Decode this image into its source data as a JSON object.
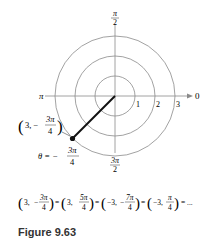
{
  "figure": {
    "caption": "Figure 9.63",
    "axis_labels": {
      "top_num": "π",
      "top_den": "2",
      "bottom_num": "3π",
      "bottom_den": "2",
      "left": "π",
      "right": "0"
    },
    "ring_labels": [
      "1",
      "2",
      "3"
    ],
    "point": {
      "r": "3",
      "theta_num": "3π",
      "theta_den": "4",
      "theta_sign": "−",
      "label_prefix": "3, −"
    },
    "theta_label": {
      "lhs": "θ = −",
      "num": "3π",
      "den": "4"
    },
    "equivalence": {
      "terms": [
        {
          "r": "3,",
          "sign": "−",
          "num": "3π",
          "den": "4"
        },
        {
          "r": "3,",
          "sign": "",
          "num": "5π",
          "den": "4"
        },
        {
          "r": "−3,",
          "sign": "−",
          "num": "7π",
          "den": "4"
        },
        {
          "r": "−3,",
          "sign": "",
          "num": "π",
          "den": "4"
        }
      ],
      "eq": "=",
      "ellipsis": "= ..."
    }
  },
  "colors": {
    "grid": "#8a8a8a",
    "ray": "#111111",
    "text": "#222222"
  }
}
